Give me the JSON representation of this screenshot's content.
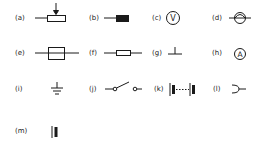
{
  "figure": {
    "title": "",
    "symbols": [
      {
        "label": "(a)",
        "name": "variable-resistor"
      },
      {
        "label": "(b)",
        "name": "heater-element"
      },
      {
        "label": "(c)",
        "name": "voltmeter",
        "glyph": "V"
      },
      {
        "label": "(d)",
        "name": "lamp"
      },
      {
        "label": "(e)",
        "name": "fuse"
      },
      {
        "label": "(f)",
        "name": "resistor"
      },
      {
        "label": "(g)",
        "name": "earth-chassis"
      },
      {
        "label": "(h)",
        "name": "ammeter",
        "glyph": "A"
      },
      {
        "label": "(i)",
        "name": "earth-ground"
      },
      {
        "label": "(j)",
        "name": "switch"
      },
      {
        "label": "(k)",
        "name": "battery"
      },
      {
        "label": "(l)",
        "name": "plug-socket"
      },
      {
        "label": "(m)",
        "name": "cell"
      }
    ]
  },
  "colors": {
    "stroke": "#1a1a1a",
    "background": "#ffffff"
  }
}
